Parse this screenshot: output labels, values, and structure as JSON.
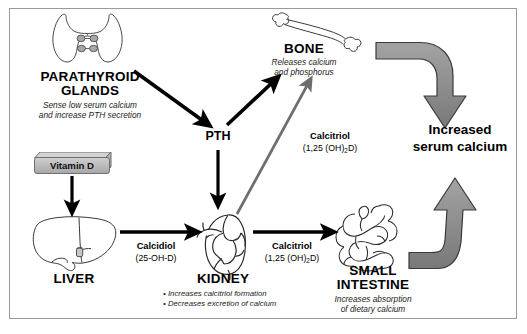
{
  "diagram": {
    "colors": {
      "frame_border": "#9a9a9a",
      "black_arrow": "#000000",
      "gray_arrow": "#6e6e6e",
      "thick_gray_arrow_fill": "#8c8c8c",
      "thick_gray_arrow_stroke": "#3a3a3a",
      "organ_outline": "#3a3a3a",
      "vitamin_d_box": "#b9b9b9",
      "background": "#ffffff"
    }
  },
  "nodes": {
    "parathyroid": {
      "icon": "parathyroid-glands-icon",
      "title_line1": "PARATHYROID",
      "title_line2": "GLANDS",
      "sub_line1": "Sense low serum calcium",
      "sub_line2": "and  increase PTH secretion"
    },
    "vitamin_d": {
      "label": "Vitamin D"
    },
    "liver": {
      "icon": "liver-icon",
      "title": "LIVER"
    },
    "kidney": {
      "icon": "kidney-icon",
      "title": "KIDNEY",
      "bullets": [
        "• Increases calcitriol formation",
        "• Decreases excretion of calcium"
      ]
    },
    "small_intestine": {
      "icon": "small-intestine-icon",
      "title_line1": "SMALL",
      "title_line2": "INTESTINE",
      "sub_line1": "Increases absorption",
      "sub_line2": "of dietary calcium"
    },
    "bone": {
      "icon": "bone-icon",
      "title": "BONE",
      "sub_line1": "Releases calcium",
      "sub_line2": "and phosphorus"
    },
    "pth": {
      "label": "PTH"
    },
    "outcome": {
      "line1": "Increased",
      "line2": "serum calcium"
    }
  },
  "edge_labels": {
    "calcidiol": {
      "name": "Calcidiol",
      "formula": "(25-OH-D)"
    },
    "calcitriol_intestine": {
      "name": "Calcitriol",
      "formula_pre": "(1,25 (OH)",
      "formula_sub": "2",
      "formula_post": "D)"
    },
    "calcitriol_bone": {
      "name": "Calcitriol",
      "formula_pre": "(1,25 (OH)",
      "formula_sub": "2",
      "formula_post": "D)"
    }
  }
}
